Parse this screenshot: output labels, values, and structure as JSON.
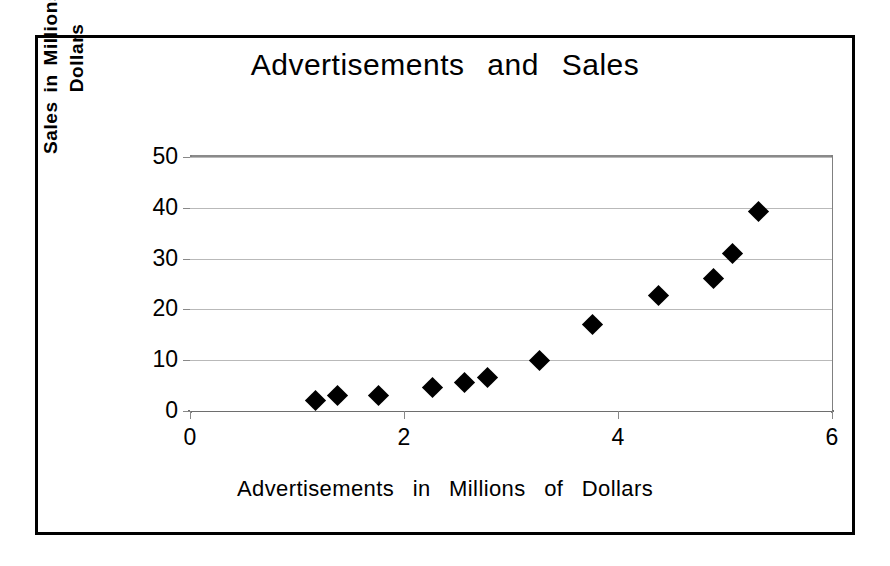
{
  "chart_data": {
    "type": "scatter",
    "title": "Advertisements   and   Sales",
    "xlabel": "Advertisements   in   Millions   of   Dollars",
    "ylabel_line1": "Sales in Millions of",
    "ylabel_line2": "Dollars",
    "ylabel": "Sales in Millions of Dollars",
    "xlim": [
      0,
      6
    ],
    "ylim": [
      0,
      50
    ],
    "xticks": [
      0,
      2,
      4,
      6
    ],
    "yticks": [
      0,
      10,
      20,
      30,
      40,
      50
    ],
    "xtick_labels": [
      "0",
      "2",
      "4",
      "6"
    ],
    "ytick_labels": [
      "0",
      "10",
      "20",
      "30",
      "40",
      "50"
    ],
    "grid": "horizontal",
    "legend": "none",
    "marker": "diamond",
    "marker_color": "#000000",
    "points": [
      {
        "x": 1.17,
        "y": 2.0
      },
      {
        "x": 1.38,
        "y": 3.1
      },
      {
        "x": 1.76,
        "y": 3.0
      },
      {
        "x": 2.27,
        "y": 4.7
      },
      {
        "x": 2.57,
        "y": 5.7
      },
      {
        "x": 2.78,
        "y": 6.5
      },
      {
        "x": 3.27,
        "y": 10.0
      },
      {
        "x": 3.76,
        "y": 17.0
      },
      {
        "x": 4.38,
        "y": 22.8
      },
      {
        "x": 4.89,
        "y": 26.0
      },
      {
        "x": 5.07,
        "y": 31.0
      },
      {
        "x": 5.31,
        "y": 39.2
      }
    ]
  },
  "figure": {
    "border_color": "#000000",
    "background": "#ffffff",
    "gridline_color": "#b9b9b9",
    "axis_color": "#808080"
  }
}
